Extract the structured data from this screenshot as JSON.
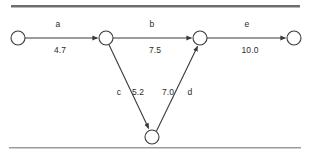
{
  "diagram": {
    "type": "directed-activity-network",
    "title": "",
    "colors": {
      "edge": "#3a3a3a",
      "node_stroke": "#3a3a3a",
      "node_fill": "#ffffff",
      "text": "#2b2b2b",
      "rule_top": "#6d6d6d",
      "rule_bottom": "#9a9a9a"
    },
    "nodes": [
      {
        "id": "n1",
        "label": "",
        "cx": 18,
        "cy": 38,
        "r": 7
      },
      {
        "id": "n2",
        "label": "",
        "cx": 106,
        "cy": 38,
        "r": 7
      },
      {
        "id": "n3",
        "label": "",
        "cx": 200,
        "cy": 38,
        "r": 7
      },
      {
        "id": "n4",
        "label": "",
        "cx": 294,
        "cy": 38,
        "r": 7
      },
      {
        "id": "n5",
        "label": "",
        "cx": 152,
        "cy": 137,
        "r": 7
      }
    ],
    "edges": [
      {
        "id": "e-a",
        "from": "n1",
        "to": "n2",
        "name": "a",
        "value": "4.7",
        "name_x": 58,
        "name_y": 24,
        "value_x": 60,
        "value_y": 50
      },
      {
        "id": "e-b",
        "from": "n2",
        "to": "n3",
        "name": "b",
        "value": "7.5",
        "name_x": 152,
        "name_y": 24,
        "value_x": 155,
        "value_y": 50
      },
      {
        "id": "e-c",
        "from": "n2",
        "to": "n5",
        "name": "c",
        "value": "5.2",
        "name_x": 119,
        "name_y": 92,
        "value_x": 138,
        "value_y": 92
      },
      {
        "id": "e-d",
        "from": "n5",
        "to": "n3",
        "name": "d",
        "value": "7.0",
        "name_x": 190,
        "name_y": 92,
        "value_x": 168,
        "value_y": 92
      },
      {
        "id": "e-e",
        "from": "n3",
        "to": "n4",
        "name": "e",
        "value": "10.0",
        "name_x": 247,
        "name_y": 24,
        "value_x": 250,
        "value_y": 50
      }
    ],
    "rules": {
      "top": {
        "x": 11,
        "y": 5,
        "width": 289
      },
      "bottom": {
        "x": 9,
        "y": 147,
        "width": 292
      }
    }
  }
}
